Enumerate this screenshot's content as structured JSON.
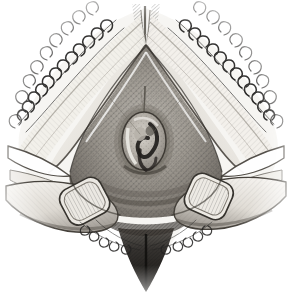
{
  "figure": {
    "kind": "medical-engraving",
    "medium": "monochrome line-and-stipple engraving",
    "title": "Perineal examination engraving",
    "caption": "",
    "background_color": "#ffffff",
    "ink_color": "#2b2b2b",
    "midtone_color": "#8a8a8a",
    "highlight_color": "#f4f2ee",
    "width_px": 291,
    "height_px": 296,
    "has_visible_text": false,
    "has_labels": false,
    "has_border": false
  },
  "regions": {
    "apex": {
      "name": "upper-apex-fold",
      "description": "narrow vertical cleft at top centre flanked by two pale highlight ridges meeting in a point",
      "center_x": 146,
      "center_y": 42,
      "tone": "light"
    },
    "central_field": {
      "name": "central-triangular-field",
      "description": "broad triangular shaded field of cross-hatched midtone filling the middle of the plate",
      "center_x": 146,
      "center_y": 150,
      "tone": "midtone"
    },
    "orifice": {
      "name": "central-ring-structure",
      "description": "small oval ring with a pale rim and dark interior hook, the focal point of the plate",
      "center_x": 144,
      "center_y": 140,
      "width": 46,
      "height": 60,
      "tone": "mixed"
    },
    "raphe": {
      "name": "median-line",
      "description": "thin vertical line running from the apex down to the ring structure",
      "x": 145,
      "y_top": 88,
      "y_bottom": 118
    },
    "left_fold": {
      "name": "left-inner-fold",
      "description": "pale highlight band running down-left from the apex, bordered below by dark hatching",
      "tone": "highlight"
    },
    "right_fold": {
      "name": "right-inner-fold",
      "description": "pale highlight band running down-right from the apex, bordered below by dark hatching",
      "tone": "highlight"
    },
    "lower_wedge": {
      "name": "lower-dark-wedge",
      "description": "dark tapering wedge descending from the lower centre to a point near the bottom edge",
      "apex_x": 144,
      "apex_y": 290,
      "tone": "dark"
    }
  },
  "fingers": [
    {
      "name": "left-examining-finger",
      "side": "left",
      "description": "fingertip entering from the lower left with an outlined nail marked by vertical striations",
      "nail_center_x": 84,
      "nail_center_y": 201,
      "nail_width": 46,
      "nail_height": 40,
      "nail_rotation_deg": -28
    },
    {
      "name": "right-examining-finger",
      "side": "right",
      "description": "fingertip entering from the lower right with an outlined nail marked by vertical striations",
      "nail_center_x": 209,
      "nail_center_y": 196,
      "nail_width": 44,
      "nail_height": 40,
      "nail_rotation_deg": 24
    }
  ],
  "hair": {
    "name": "curly-hair-fringe",
    "description": "rows of short curled strokes following the upper-left and upper-right diagonal borders and a sparser fringe along the lower centre",
    "zones": [
      "upper-left-border",
      "upper-right-border",
      "lower-centre-fringe"
    ],
    "stroke_count_estimate": 150
  },
  "shading": {
    "technique": "cross-hatching and stipple",
    "direction_primary_deg": 45,
    "direction_secondary_deg": -45,
    "darkest_zones": [
      "lower-dark-wedge",
      "ring-interior",
      "under-fold-shadows"
    ],
    "lightest_zones": [
      "left-inner-fold",
      "right-inner-fold",
      "nail-highlights",
      "background"
    ]
  }
}
